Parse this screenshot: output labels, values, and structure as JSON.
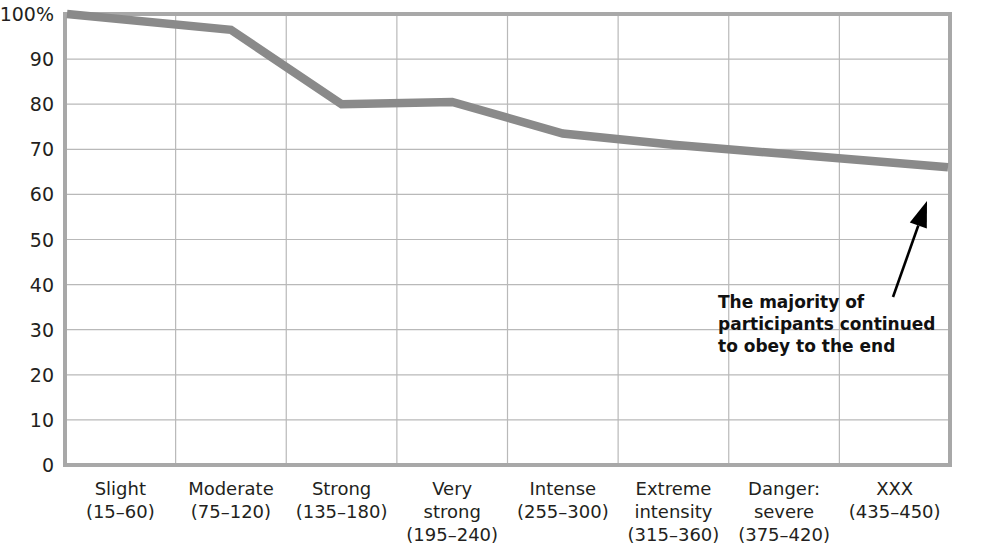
{
  "chart_data": {
    "type": "line",
    "title": "",
    "subtitle": "",
    "xlabel": "",
    "ylabel": "",
    "ylim": [
      0,
      100
    ],
    "grid": true,
    "legend_position": "none",
    "line_color": "#8a8a8a",
    "categories": [
      "Slight\n(15–60)",
      "Moderate\n(75–120)",
      "Strong\n(135–180)",
      "Very\nstrong\n(195–240)",
      "Intense\n(255–300)",
      "Extreme\nintensity\n(315–360)",
      "Danger:\nsevere\n(375–420)",
      "XXX\n(435–450)"
    ],
    "category_lines": [
      [
        "Slight",
        "(15–60)"
      ],
      [
        "Moderate",
        "(75–120)"
      ],
      [
        "Strong",
        "(135–180)"
      ],
      [
        "Very",
        "strong",
        "(195–240)"
      ],
      [
        "Intense",
        "(255–300)"
      ],
      [
        "Extreme",
        "intensity",
        "(315–360)"
      ],
      [
        "Danger:",
        "severe",
        "(375–420)"
      ],
      [
        "XXX",
        "(435–450)"
      ]
    ],
    "values": [
      100,
      96.5,
      80,
      80.5,
      73.5,
      71,
      69,
      66
    ],
    "ytick_labels": [
      "100%",
      "90",
      "80",
      "70",
      "60",
      "50",
      "40",
      "30",
      "20",
      "10",
      "0"
    ],
    "ytick_values": [
      100,
      90,
      80,
      70,
      60,
      50,
      40,
      30,
      20,
      10,
      0
    ],
    "annotations": [
      {
        "name": "majority-obeyed-note",
        "lines": [
          "The majority of",
          "participants continued",
          "to obey to the end"
        ],
        "arrow": {
          "from_x": 893,
          "from_y": 297,
          "to_x": 927,
          "to_y": 201
        }
      }
    ]
  }
}
